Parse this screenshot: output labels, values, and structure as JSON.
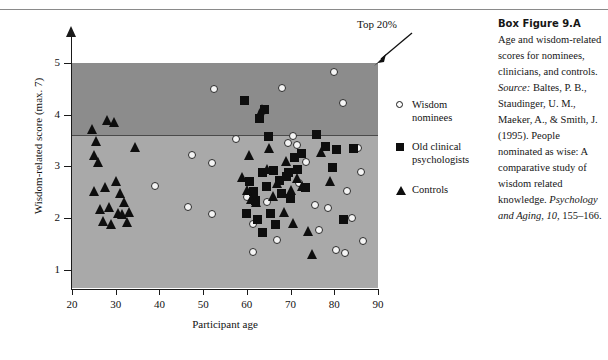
{
  "figure": {
    "top20_label": "Top 20%",
    "axes": {
      "y_title": "Wisdom-related score (max. 7)",
      "x_title": "Participant age",
      "y_ticks": [
        "5",
        "4",
        "3",
        "2",
        "1"
      ],
      "x_ticks": [
        "20",
        "30",
        "40",
        "50",
        "60",
        "70",
        "80",
        "90"
      ]
    }
  },
  "legend": {
    "items": [
      {
        "marker": "open-circle",
        "line1": "Wisdom",
        "line2": "nominees"
      },
      {
        "marker": "filled-square",
        "line1": "Old clinical",
        "line2": "psychologists"
      },
      {
        "marker": "filled-triangle",
        "line1": "Controls",
        "line2": ""
      }
    ]
  },
  "caption": {
    "title": "Box Figure 9.A",
    "body_1": "Age and wisdom-related scores for nominees, clinicians, and controls. ",
    "source_label": "Source:",
    "body_2": " Baltes, P. B., Staudinger, U. M., Maeker, A., & Smith, J. (1995). People nominated as wise: A comparative study of wisdom related knowledge. ",
    "journal": "Psychology and Aging, 10,",
    "body_3": " 155–166."
  },
  "colors": {
    "plot_background_lower": "#a9a9a9",
    "plot_background_upper": "#8c8c8c",
    "axis": "#1a1a1a",
    "marker_fill": "#0e0e0e",
    "open_marker_fill": "#f4f4f4",
    "page_background": "#ffffff"
  },
  "chart_data": {
    "type": "scatter",
    "title": "Age and wisdom-related scores for nominees, clinicians, and controls",
    "xlabel": "Participant age",
    "ylabel": "Wisdom-related score (max. 7)",
    "xlim": [
      20,
      90
    ],
    "ylim": [
      0.65,
      5.0
    ],
    "grid": false,
    "legend_position": "right",
    "annotations": [
      {
        "text": "Top 20%",
        "points_to": "top-right corner of shaded region",
        "threshold_y": 3.48
      }
    ],
    "shaded_bands": [
      {
        "label": "Top 20%",
        "y_from": 3.48,
        "y_to": 5.0,
        "color": "#8c8c8c"
      },
      {
        "label": "Lower 80%",
        "y_from": 0.65,
        "y_to": 3.48,
        "color": "#a9a9a9"
      }
    ],
    "series": [
      {
        "name": "Wisdom nominees",
        "marker": "open-circle",
        "points": [
          [
            39.0,
            2.62
          ],
          [
            46.5,
            2.22
          ],
          [
            47.5,
            3.22
          ],
          [
            52.5,
            4.5
          ],
          [
            52.0,
            3.07
          ],
          [
            52.0,
            2.08
          ],
          [
            57.5,
            3.53
          ],
          [
            60.0,
            2.4
          ],
          [
            61.5,
            1.88
          ],
          [
            61.5,
            1.35
          ],
          [
            63.5,
            4.05
          ],
          [
            64.5,
            2.32
          ],
          [
            67.0,
            1.58
          ],
          [
            68.0,
            4.52
          ],
          [
            69.5,
            3.45
          ],
          [
            70.5,
            3.58
          ],
          [
            71.5,
            3.42
          ],
          [
            72.0,
            2.68
          ],
          [
            73.5,
            3.08
          ],
          [
            75.5,
            2.25
          ],
          [
            76.5,
            1.78
          ],
          [
            78.5,
            2.2
          ],
          [
            80.0,
            4.82
          ],
          [
            80.5,
            1.38
          ],
          [
            82.0,
            4.22
          ],
          [
            82.5,
            1.32
          ],
          [
            83.0,
            2.52
          ],
          [
            84.0,
            2.0
          ],
          [
            85.5,
            3.35
          ],
          [
            86.0,
            2.9
          ],
          [
            86.5,
            1.55
          ]
        ]
      },
      {
        "name": "Old clinical psychologists",
        "marker": "filled-square",
        "points": [
          [
            59.5,
            4.28
          ],
          [
            60.0,
            2.1
          ],
          [
            60.5,
            2.7
          ],
          [
            61.5,
            2.52
          ],
          [
            62.0,
            2.35
          ],
          [
            62.5,
            1.98
          ],
          [
            63.0,
            3.93
          ],
          [
            63.5,
            2.88
          ],
          [
            63.5,
            1.72
          ],
          [
            64.0,
            4.1
          ],
          [
            64.5,
            2.62
          ],
          [
            65.0,
            3.58
          ],
          [
            65.5,
            2.1
          ],
          [
            66.0,
            2.92
          ],
          [
            66.5,
            1.88
          ],
          [
            67.5,
            2.72
          ],
          [
            68.0,
            2.48
          ],
          [
            69.0,
            2.8
          ],
          [
            69.5,
            2.88
          ],
          [
            70.0,
            2.38
          ],
          [
            71.0,
            3.18
          ],
          [
            71.5,
            2.95
          ],
          [
            72.5,
            3.25
          ],
          [
            73.5,
            2.6
          ],
          [
            76.0,
            3.62
          ],
          [
            78.0,
            3.38
          ],
          [
            79.5,
            2.98
          ],
          [
            80.5,
            3.32
          ],
          [
            82.0,
            1.98
          ],
          [
            84.5,
            3.35
          ]
        ]
      },
      {
        "name": "Controls",
        "marker": "filled-triangle",
        "points": [
          [
            24.5,
            3.72
          ],
          [
            25.0,
            3.22
          ],
          [
            25.0,
            2.52
          ],
          [
            25.5,
            3.5
          ],
          [
            26.0,
            3.08
          ],
          [
            26.5,
            2.18
          ],
          [
            27.0,
            1.95
          ],
          [
            27.5,
            2.6
          ],
          [
            28.0,
            3.9
          ],
          [
            28.5,
            2.22
          ],
          [
            29.0,
            1.88
          ],
          [
            29.5,
            3.85
          ],
          [
            30.0,
            2.72
          ],
          [
            30.5,
            2.1
          ],
          [
            31.0,
            2.48
          ],
          [
            31.5,
            2.08
          ],
          [
            32.0,
            2.32
          ],
          [
            32.5,
            1.92
          ],
          [
            33.0,
            2.12
          ],
          [
            34.5,
            3.38
          ],
          [
            59.0,
            2.8
          ],
          [
            60.0,
            2.55
          ],
          [
            60.5,
            3.22
          ],
          [
            61.0,
            2.38
          ],
          [
            62.0,
            2.32
          ],
          [
            63.5,
            4.12
          ],
          [
            64.5,
            2.95
          ],
          [
            65.0,
            3.35
          ],
          [
            66.0,
            2.42
          ],
          [
            67.0,
            2.68
          ],
          [
            68.5,
            2.12
          ],
          [
            69.0,
            3.1
          ],
          [
            70.0,
            2.55
          ],
          [
            70.5,
            1.9
          ],
          [
            71.5,
            2.78
          ],
          [
            72.5,
            2.62
          ],
          [
            74.0,
            1.75
          ],
          [
            75.0,
            1.3
          ],
          [
            77.0,
            3.28
          ],
          [
            79.0,
            2.72
          ]
        ]
      }
    ]
  }
}
